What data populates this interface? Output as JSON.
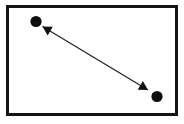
{
  "figure": {
    "title": "",
    "caption": "",
    "background_color": "#ffffff",
    "ink_color": "#111111",
    "frame": {
      "name": "rectangular-border",
      "x": 7.5,
      "y": 6.5,
      "width": 169,
      "height": 108,
      "stroke_color": "#151515",
      "stroke_width": 3
    },
    "nodes": [
      {
        "id": "node-upper-left",
        "label": "",
        "cx": 36,
        "cy": 21.5,
        "r": 5.6,
        "fill": "#0d0d0d"
      },
      {
        "id": "node-lower-right",
        "label": "",
        "cx": 157,
        "cy": 96.5,
        "r": 5.6,
        "fill": "#0d0d0d"
      }
    ],
    "connector": {
      "id": "double-headed-arrow",
      "label": "",
      "x1": 148,
      "y1": 90,
      "x2": 42.5,
      "y2": 26.5,
      "stroke_color": "#1a1a1a",
      "stroke_width": 1.1,
      "arrowhead_start": true,
      "arrowhead_end": true,
      "arrowhead_length": 9,
      "arrowhead_width": 5
    }
  }
}
